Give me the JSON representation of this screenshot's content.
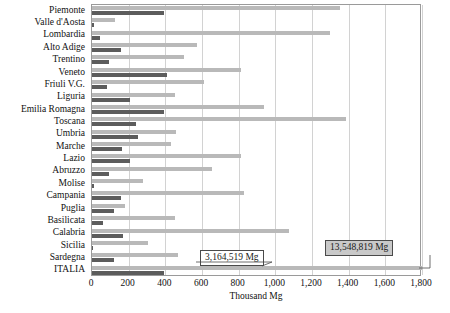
{
  "chart_data": {
    "type": "bar",
    "orientation": "horizontal",
    "title": "",
    "xlabel": "Thousand Mg",
    "ylabel": "",
    "xlim": [
      0,
      1800
    ],
    "xticks": [
      0,
      200,
      400,
      600,
      800,
      1000,
      1200,
      1400,
      1600,
      1800
    ],
    "xtick_labels": [
      "0",
      "200",
      "400",
      "600",
      "800",
      "1,000",
      "1,200",
      "1,400",
      "1,600",
      "1,800"
    ],
    "grid": true,
    "legend": "none",
    "categories": [
      "Piemonte",
      "Valle d'Aosta",
      "Lombardia",
      "Alto Adige",
      "Trentino",
      "Veneto",
      "Friuli V.G.",
      "Liguria",
      "Emilia Romagna",
      "Toscana",
      "Umbria",
      "Marche",
      "Lazio",
      "Abruzzo",
      "Molise",
      "Campania",
      "Puglia",
      "Basilicata",
      "Calabria",
      "Sicilia",
      "Sardegna",
      "ITALIA"
    ],
    "series": [
      {
        "name": "light",
        "color": "#b9b9b9",
        "values": [
          1350,
          128,
          1300,
          575,
          500,
          815,
          610,
          450,
          940,
          1385,
          460,
          430,
          810,
          657,
          280,
          827,
          180,
          455,
          1073,
          308,
          470,
          1800
        ]
      },
      {
        "name": "dark",
        "color": "#5c5c5c",
        "values": [
          390,
          10,
          45,
          160,
          95,
          410,
          80,
          208,
          395,
          242,
          252,
          162,
          205,
          95,
          12,
          160,
          118,
          62,
          170,
          8,
          122,
          390
        ]
      }
    ],
    "annotations": [
      {
        "text": "3,164,519 Mg",
        "style": "white-box"
      },
      {
        "text": "13,548,819 Mg",
        "style": "grey-box"
      }
    ],
    "colors": {
      "light_bar": "#b9b9b9",
      "dark_bar": "#5c5c5c",
      "grid": "#d2d2d2",
      "frame": "#9a9a9a"
    }
  }
}
